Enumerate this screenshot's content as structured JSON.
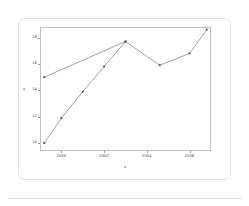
{
  "chart_data": {
    "type": "line",
    "title": "",
    "xlabel": "x",
    "ylabel": "y",
    "xlim": [
      1999,
      2007
    ],
    "ylim": [
      9.4,
      18.8
    ],
    "grid": false,
    "legend": false,
    "xticks": [
      2000,
      2002,
      2004,
      2006
    ],
    "xtick_labels": [
      "2000",
      "2002",
      "2004",
      "2006"
    ],
    "yticks": [
      10,
      12,
      14,
      16,
      18
    ],
    "ytick_labels": [
      "10",
      "12",
      "14",
      "16",
      "18"
    ],
    "marker": "square",
    "line_color": "#555555",
    "marker_color": "#444444",
    "series": [
      {
        "name": "series-1",
        "x": [
          1999.2,
          2000.0,
          2001.0,
          2002.0,
          2003.0
        ],
        "y": [
          10.0,
          11.9,
          13.9,
          15.8,
          17.7
        ],
        "comment": "steep rising line"
      },
      {
        "name": "series-2",
        "x": [
          1999.2,
          2003.0,
          2004.6,
          2006.0,
          2006.8
        ],
        "y": [
          15.0,
          17.7,
          15.9,
          16.8,
          18.6
        ],
        "comment": "shallow line crossing series-1"
      }
    ]
  },
  "axis": {
    "x_title": "x",
    "y_title": "y"
  }
}
